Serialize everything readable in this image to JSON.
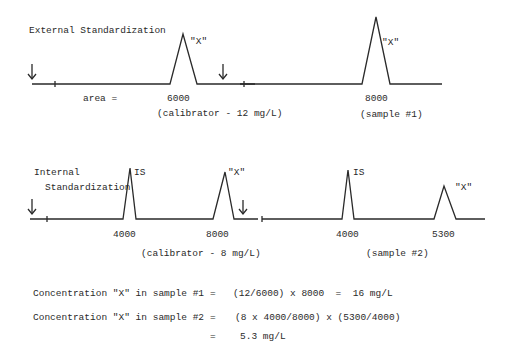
{
  "external": {
    "title": "External Standardization",
    "area_label": "area =",
    "peak1_label": "\"X\"",
    "peak1_area": "6000",
    "calibrator_label": "(calibrator - 12 mg/L)",
    "peak2_label": "\"X\"",
    "peak2_area": "8000",
    "sample_label": "(sample #1)"
  },
  "internal": {
    "title_line1": "Internal",
    "title_line2": "Standardization",
    "peak_is1_label": "IS",
    "peak_is1_area": "4000",
    "peak_x1_label": "\"X\"",
    "peak_x1_area": "8000",
    "calibrator_label": "(calibrator - 8 mg/L)",
    "peak_is2_label": "IS",
    "peak_is2_area": "4000",
    "peak_x2_label": "\"X\"",
    "peak_x2_area": "5300",
    "sample_label": "(sample #2)"
  },
  "equations": {
    "eq1_left": "Concentration \"X\" in sample #1",
    "eq1_eq": "=",
    "eq1_right": "(12/6000) x 8000  =  16 mg/L",
    "eq2_left": "Concentration \"X\" in sample #2",
    "eq2_eq": "=",
    "eq2_right": "(8 x 4000/8000) x (5300/4000)",
    "eq3_eq": "=",
    "eq3_right": "5.3 mg/L"
  }
}
